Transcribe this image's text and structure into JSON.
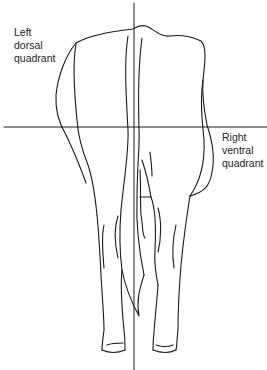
{
  "figure": {
    "labels": {
      "left_dorsal": "Left\ndorsal\nquadrant",
      "right_ventral": "Right\nventral\nquadrant"
    },
    "axes": {
      "vertical_line_x": 134,
      "horizontal_line_y": 127
    },
    "colors": {
      "line": "#1a1a1a",
      "background": "#ffffff",
      "text": "#222222"
    }
  }
}
